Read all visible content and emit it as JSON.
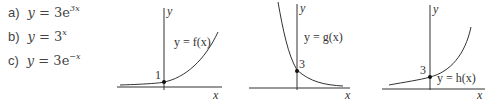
{
  "equations": [
    {
      "label": "a)",
      "lhs": "y",
      "eq": " = 3e",
      "exp": "3x"
    },
    {
      "label": "b)",
      "lhs": "y",
      "eq": " = 3",
      "exp": "x"
    },
    {
      "label": "c)",
      "lhs": "y",
      "eq": " = 3e",
      "exp": "−x"
    }
  ],
  "graphs": [
    {
      "curve_label": "y = f(x)",
      "intercept": "1",
      "x_axis": "x",
      "y_axis": "y",
      "shape": "increasing exponential"
    },
    {
      "curve_label": "y = g(x)",
      "intercept": "3",
      "x_axis": "x",
      "y_axis": "y",
      "shape": "decreasing exponential"
    },
    {
      "curve_label": "y = h(x)",
      "intercept": "3",
      "x_axis": "x",
      "y_axis": "y",
      "shape": "increasing exponential"
    }
  ]
}
